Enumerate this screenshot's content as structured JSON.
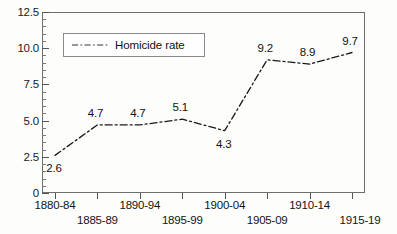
{
  "chart_data": {
    "type": "line",
    "title": "",
    "xlabel": "",
    "ylabel": "",
    "categories": [
      "1880-84",
      "1885-89",
      "1890-94",
      "1895-99",
      "1900-04",
      "1905-09",
      "1910-14",
      "1915-19"
    ],
    "values": [
      2.6,
      4.7,
      4.7,
      5.1,
      4.3,
      9.2,
      8.9,
      9.7
    ],
    "point_labels": [
      "2.6",
      "4.7",
      "4.7",
      "5.1",
      "4.3",
      "9.2",
      "8.9",
      "9.7"
    ],
    "series": [
      {
        "name": "Homicide rate",
        "values": [
          2.6,
          4.7,
          4.7,
          5.1,
          4.3,
          9.2,
          8.9,
          9.7
        ]
      }
    ],
    "ylim": [
      0,
      12.5
    ],
    "y_major_ticks": [
      "0",
      "2.5",
      "5.0",
      "7.5",
      "10.0",
      "12.5"
    ],
    "y_major_values": [
      0,
      2.5,
      5.0,
      7.5,
      10.0,
      12.5
    ],
    "y_minor_step": 0.5,
    "grid": false,
    "legend_position": "top-left",
    "line_style": "dash-dot",
    "line_color": "#1a1a1a"
  },
  "legend": {
    "label": "Homicide rate"
  },
  "axes": {
    "y_labels": [
      "12.5",
      "10.0",
      "7.5",
      "5.0",
      "2.5",
      "0"
    ],
    "x_labels": [
      "1880-84",
      "1885-89",
      "1890-94",
      "1895-99",
      "1900-04",
      "1905-09",
      "1910-14",
      "1915-19"
    ]
  }
}
